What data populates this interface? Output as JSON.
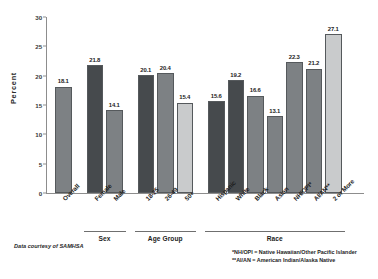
{
  "chart_data": {
    "type": "bar",
    "title": "",
    "subtitle": "",
    "xlabel": "",
    "ylabel": "Percent",
    "ylim": [
      0,
      30
    ],
    "yticks": [
      0,
      5,
      10,
      15,
      20,
      25,
      30
    ],
    "ytick_labels": [
      "0",
      "5",
      "10",
      "15",
      "20",
      "25",
      "30"
    ],
    "grid": false,
    "legend": "none",
    "categories": [
      "Overall",
      "Female",
      "Male",
      "18-25",
      "26-49",
      "50+",
      "Hispanic",
      "White",
      "Black",
      "Asian",
      "NH/OPI*",
      "AI/AN**",
      "2 or More"
    ],
    "values": [
      18.1,
      21.8,
      14.1,
      20.1,
      20.4,
      15.4,
      15.6,
      19.2,
      16.6,
      13.1,
      22.3,
      21.2,
      27.1
    ],
    "value_labels": [
      "18.1",
      "21.8",
      "14.1",
      "20.1",
      "20.4",
      "15.4",
      "15.6",
      "19.2",
      "16.6",
      "13.1",
      "22.3",
      "21.2",
      "27.1"
    ],
    "bar_shades": [
      "mid",
      "dark",
      "mid",
      "dark",
      "mid",
      "light",
      "dark",
      "dark",
      "mid",
      "mid",
      "mid",
      "mid",
      "light"
    ],
    "groups": [
      {
        "label": "Sex",
        "start": 1,
        "end": 2
      },
      {
        "label": "Age Group",
        "start": 3,
        "end": 5
      },
      {
        "label": "Race",
        "start": 6,
        "end": 12
      }
    ],
    "annotations": [
      "*NH/OPI = Native Hawaiian/Other Pacific Islander",
      "**AI/AN = American Indian/Alaska Native"
    ],
    "source": "Data courtesy of SAMHSA",
    "colors": {
      "bar_dark": "#464a4d",
      "bar_mid": "#7d8184",
      "bar_light": "#c9cbcc",
      "axis": "#8d8d8d",
      "text": "#1d1d1d",
      "background": "#ffffff"
    }
  }
}
